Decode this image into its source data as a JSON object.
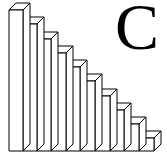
{
  "figure": {
    "letter": "C",
    "stroke_color": "#000000",
    "fill_color": "#ffffff"
  },
  "chart_data": {
    "type": "bar",
    "title": "",
    "xlabel": "",
    "ylabel": "",
    "categories": [
      "1",
      "2",
      "3",
      "4",
      "5",
      "6",
      "7",
      "8",
      "9",
      "10"
    ],
    "values": [
      10,
      9,
      8,
      7,
      6,
      5,
      4,
      3,
      2,
      1
    ],
    "annotations": [
      "C"
    ],
    "grid": false,
    "legend": "none"
  },
  "bars": [
    {
      "x": 9,
      "w": 14,
      "top": 10
    },
    {
      "x": 23,
      "w": 14,
      "top": 24
    },
    {
      "x": 37,
      "w": 14,
      "top": 39
    },
    {
      "x": 51,
      "w": 15,
      "top": 53
    },
    {
      "x": 66,
      "w": 14,
      "top": 67
    },
    {
      "x": 80,
      "w": 15,
      "top": 81
    },
    {
      "x": 95,
      "w": 15,
      "top": 96
    },
    {
      "x": 110,
      "w": 14,
      "top": 110
    },
    {
      "x": 124,
      "w": 15,
      "top": 124
    },
    {
      "x": 139,
      "w": 15,
      "top": 138
    }
  ],
  "baseline": 151,
  "depth": {
    "dx": 7,
    "dy": -7
  }
}
